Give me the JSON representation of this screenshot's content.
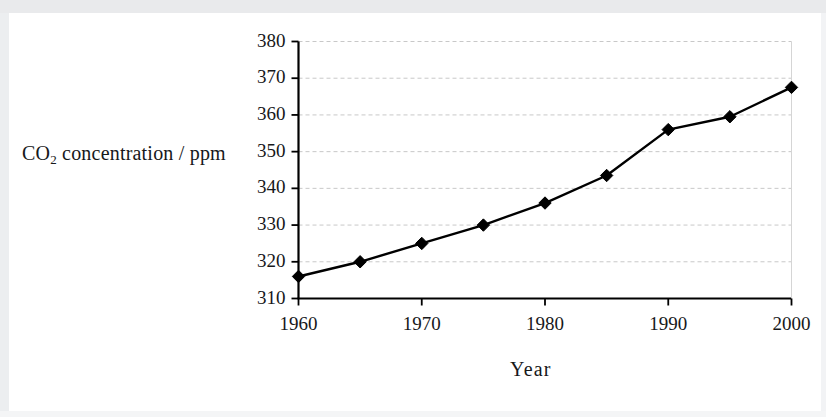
{
  "figure": {
    "y_axis_title_main": "CO",
    "y_axis_title_sub": "2",
    "y_axis_title_rest": " concentration / ppm",
    "x_axis_title": "Year"
  },
  "chart_data": {
    "type": "line",
    "title": "",
    "xlabel": "Year",
    "ylabel": "CO2 concentration / ppm",
    "xlim": [
      1960,
      2000
    ],
    "ylim": [
      310,
      380
    ],
    "xticks": [
      1960,
      1970,
      1980,
      1990,
      2000
    ],
    "xtick_labels": [
      "1960",
      "1970",
      "1980",
      "1990",
      "2000"
    ],
    "yticks": [
      310,
      320,
      330,
      340,
      350,
      360,
      370,
      380
    ],
    "ytick_labels": [
      "310",
      "320",
      "330",
      "340",
      "350",
      "360",
      "370",
      "380"
    ],
    "x_minor_ticks": [
      1965,
      1975,
      1985,
      1995
    ],
    "grid": true,
    "grid_axis": "y",
    "grid_style": "dashed",
    "legend": false,
    "marker": "diamond",
    "line_color": "#000000",
    "marker_color": "#000000",
    "grid_color": "#c8c8c8",
    "axis_color": "#000000",
    "background_color": "#ffffff",
    "x": [
      1960,
      1965,
      1970,
      1975,
      1980,
      1985,
      1990,
      1995,
      2000
    ],
    "values": [
      316,
      320,
      325,
      330,
      336,
      343.5,
      356,
      359.5,
      367.5
    ],
    "series": [
      {
        "name": "CO2 concentration",
        "values": [
          316,
          320,
          325,
          330,
          336,
          343.5,
          356,
          359.5,
          367.5
        ]
      }
    ]
  }
}
